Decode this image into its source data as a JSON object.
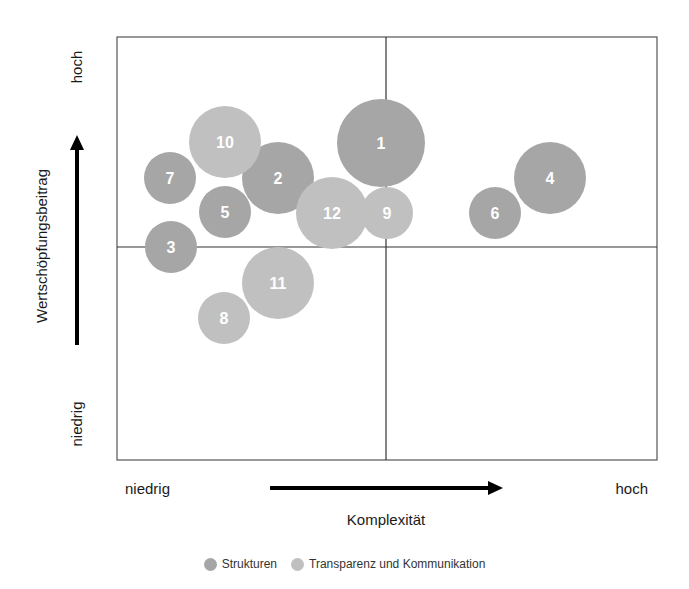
{
  "chart_data": {
    "type": "bubble",
    "title": "",
    "xlabel": "Komplexität",
    "ylabel": "Wertschöpfungsbeitrag",
    "x_axis": {
      "low_label": "niedrig",
      "high_label": "hoch"
    },
    "y_axis": {
      "low_label": "niedrig",
      "high_label": "hoch"
    },
    "quadrants": true,
    "grid": false,
    "legend_position": "bottom",
    "series": [
      {
        "name": "Strukturen",
        "color": "#a6a6a6",
        "points": [
          {
            "id": "1",
            "x": 0.49,
            "y": 0.75,
            "size": "large"
          },
          {
            "id": "2",
            "x": 0.3,
            "y": 0.67,
            "size": "medium"
          },
          {
            "id": "3",
            "x": 0.1,
            "y": 0.5,
            "size": "small"
          },
          {
            "id": "4",
            "x": 0.8,
            "y": 0.67,
            "size": "medium"
          },
          {
            "id": "5",
            "x": 0.2,
            "y": 0.59,
            "size": "small"
          },
          {
            "id": "6",
            "x": 0.7,
            "y": 0.59,
            "size": "small"
          },
          {
            "id": "7",
            "x": 0.1,
            "y": 0.67,
            "size": "small"
          }
        ]
      },
      {
        "name": "Transparenz und Kommunikation",
        "color": "#c0c0c0",
        "points": [
          {
            "id": "8",
            "x": 0.2,
            "y": 0.34,
            "size": "small"
          },
          {
            "id": "9",
            "x": 0.5,
            "y": 0.59,
            "size": "small"
          },
          {
            "id": "10",
            "x": 0.2,
            "y": 0.75,
            "size": "medium"
          },
          {
            "id": "11",
            "x": 0.3,
            "y": 0.42,
            "size": "medium"
          },
          {
            "id": "12",
            "x": 0.4,
            "y": 0.59,
            "size": "medium"
          }
        ]
      }
    ]
  },
  "bubbles": [
    {
      "label": "1",
      "cx": 381,
      "cy": 143,
      "r": 44,
      "series": 0
    },
    {
      "label": "2",
      "cx": 278,
      "cy": 178,
      "r": 36,
      "series": 0
    },
    {
      "label": "3",
      "cx": 171,
      "cy": 247,
      "r": 26,
      "series": 0
    },
    {
      "label": "4",
      "cx": 550,
      "cy": 178,
      "r": 36,
      "series": 0
    },
    {
      "label": "5",
      "cx": 225,
      "cy": 212,
      "r": 26,
      "series": 0
    },
    {
      "label": "6",
      "cx": 495,
      "cy": 213,
      "r": 26,
      "series": 0
    },
    {
      "label": "7",
      "cx": 170,
      "cy": 178,
      "r": 26,
      "series": 0
    },
    {
      "label": "8",
      "cx": 224,
      "cy": 318,
      "r": 26,
      "series": 1
    },
    {
      "label": "9",
      "cx": 387,
      "cy": 213,
      "r": 26,
      "series": 1
    },
    {
      "label": "10",
      "cx": 225,
      "cy": 142,
      "r": 36,
      "series": 1
    },
    {
      "label": "11",
      "cx": 278,
      "cy": 283,
      "r": 36,
      "series": 1
    },
    {
      "label": "12",
      "cx": 332,
      "cy": 213,
      "r": 36,
      "series": 1
    }
  ],
  "legend": [
    {
      "label": "Strukturen",
      "color": "#a6a6a6"
    },
    {
      "label": "Transparenz und Kommunikation",
      "color": "#c0c0c0"
    }
  ],
  "labels": {
    "x_low": "niedrig",
    "x_high": "hoch",
    "x_title": "Komplexität",
    "y_low": "niedrig",
    "y_high": "hoch",
    "y_title": "Wertschöpfungsbeitrag"
  }
}
